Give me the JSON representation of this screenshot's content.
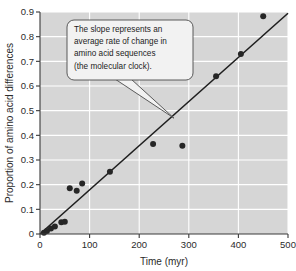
{
  "chart_data": {
    "type": "scatter",
    "title": "",
    "xlabel": "Time (myr)",
    "ylabel": "Proportion of amino acid differences",
    "xlim": [
      0,
      500
    ],
    "ylim": [
      0,
      0.9
    ],
    "xticks": [
      0,
      100,
      200,
      300,
      400,
      500
    ],
    "xtick_labels": [
      "0",
      "100",
      "200",
      "300",
      "400",
      "500"
    ],
    "yticks": [
      0,
      0.1,
      0.2,
      0.3,
      0.4,
      0.5,
      0.6,
      0.7,
      0.8,
      0.9
    ],
    "ytick_labels": [
      "0",
      "0.1",
      "0.2",
      "0.3",
      "0.4",
      "0.5",
      "0.6",
      "0.7",
      "0.8",
      "0.9"
    ],
    "grid": true,
    "legend": "none",
    "series": [
      {
        "name": "amino acid differences",
        "marker": "filled-circle",
        "color": "#262626",
        "points": [
          {
            "x": 8,
            "y": 0.005
          },
          {
            "x": 14,
            "y": 0.012
          },
          {
            "x": 22,
            "y": 0.022
          },
          {
            "x": 30,
            "y": 0.03
          },
          {
            "x": 43,
            "y": 0.048
          },
          {
            "x": 50,
            "y": 0.05
          },
          {
            "x": 60,
            "y": 0.185
          },
          {
            "x": 74,
            "y": 0.175
          },
          {
            "x": 85,
            "y": 0.205
          },
          {
            "x": 141,
            "y": 0.252
          },
          {
            "x": 228,
            "y": 0.365
          },
          {
            "x": 287,
            "y": 0.358
          },
          {
            "x": 355,
            "y": 0.64
          },
          {
            "x": 405,
            "y": 0.73
          },
          {
            "x": 450,
            "y": 0.883
          }
        ]
      }
    ],
    "fit_line": {
      "name": "regression-line",
      "color": "#1f1f1f",
      "x_start": 0,
      "y_start": 0.0,
      "x_end": 500,
      "y_end": 0.895
    },
    "annotations": [
      {
        "name": "slope-callout",
        "lines": [
          "The slope represents an",
          "average rate of change in",
          "amino acid sequences",
          "(the molecular clock)."
        ],
        "points_to_x": 270,
        "points_to_y": 0.47
      }
    ],
    "colors": {
      "plot_background": "#d6d6d6",
      "gridlines": "#ffffff",
      "axis": "#3a3a3a",
      "marker": "#262626",
      "line": "#1f1f1f",
      "callout_fill": "#f2f2f2",
      "callout_border": "#4a4a4a",
      "text": "#2b2b2b"
    }
  }
}
